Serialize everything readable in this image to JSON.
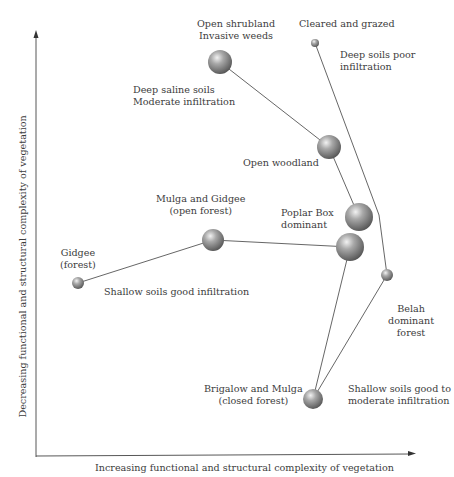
{
  "axes": {
    "x_label": "Increasing functional and structural complexity of vegetation",
    "y_label": "Decreasing functional and structural complexity of vegetation"
  },
  "nodes": [
    {
      "id": "open-shrubland",
      "lines": [
        "Open shrubland",
        "Invasive weeds"
      ],
      "x": 220,
      "y": 62,
      "r": 12
    },
    {
      "id": "cleared-grazed",
      "lines": [
        "Cleared and grazed"
      ],
      "x": 315,
      "y": 43,
      "r": 4
    },
    {
      "id": "open-woodland",
      "lines": [
        "Open woodland"
      ],
      "x": 329,
      "y": 147,
      "r": 12
    },
    {
      "id": "poplar-box",
      "lines": [
        "Poplar Box",
        "dominant"
      ],
      "x": 359,
      "y": 217,
      "r": 14
    },
    {
      "id": "junction",
      "lines": [],
      "x": 350,
      "y": 247,
      "r": 14
    },
    {
      "id": "mulga-gidgee",
      "lines": [
        "Mulga and Gidgee",
        "(open forest)"
      ],
      "x": 213,
      "y": 240,
      "r": 11
    },
    {
      "id": "gidgee-forest",
      "lines": [
        "Gidgee",
        "(forest)"
      ],
      "x": 78,
      "y": 283,
      "r": 6
    },
    {
      "id": "belah",
      "lines": [
        "Belah",
        "dominant",
        "forest"
      ],
      "x": 387,
      "y": 275,
      "r": 6
    },
    {
      "id": "brigalow-mulga",
      "lines": [
        "Brigalow and Mulga",
        "(closed forest)"
      ],
      "x": 313,
      "y": 399,
      "r": 10
    }
  ],
  "soil_annotations": {
    "deep_saline": [
      "Deep saline soils",
      "Moderate infiltration"
    ],
    "deep_poor": [
      "Deep soils poor",
      "infiltration"
    ],
    "shallow_good": [
      "Shallow soils good infiltration"
    ],
    "shallow_good_moderate": [
      "Shallow soils good to",
      "moderate infiltration"
    ]
  },
  "edges": [
    [
      "open-shrubland",
      "open-woodland"
    ],
    [
      "open-woodland",
      "poplar-box"
    ],
    [
      "cleared-grazed",
      "belah"
    ],
    [
      "gidgee-forest",
      "mulga-gidgee"
    ],
    [
      "mulga-gidgee",
      "junction"
    ],
    [
      "junction",
      "brigalow-mulga"
    ],
    [
      "belah",
      "brigalow-mulga"
    ]
  ],
  "colors": {
    "line": "#555555",
    "sphere_light": "#e8e8e8",
    "sphere_dark": "#5a5a5a",
    "text": "#3c3c3c"
  }
}
